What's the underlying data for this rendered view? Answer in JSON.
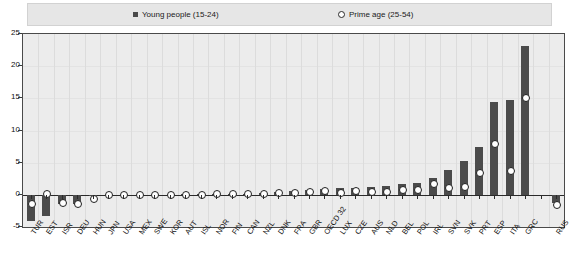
{
  "legend": {
    "young": {
      "label": "Young people (15-24)",
      "marker": "filled-square-icon",
      "color": "#4a4a4a"
    },
    "prime": {
      "label": "Prime age (25-54)",
      "marker": "open-circle-icon",
      "color": "#ffffff"
    }
  },
  "chart_data": {
    "type": "bar",
    "title": "",
    "subtitle": "",
    "xlabel": "",
    "ylabel": "",
    "ylim": [
      -5,
      25
    ],
    "yticks": [
      -5,
      0,
      5,
      10,
      15,
      20,
      25
    ],
    "ytick_labels": [
      "-5",
      "0",
      "5",
      "10",
      "15",
      "20",
      "25"
    ],
    "grid": true,
    "legend_position": "top",
    "categories": [
      "TUR",
      "EST",
      "ISR",
      "DEU",
      "HUN",
      "JPN",
      "USA",
      "MEX",
      "SWE",
      "KOR",
      "AUT",
      "ISL",
      "NOR",
      "FIN",
      "CAN",
      "NZL",
      "DNK",
      "FRA",
      "GBR",
      "OECD 32",
      "LUX",
      "CZE",
      "AUS",
      "NLD",
      "BEL",
      "POL",
      "IRL",
      "SVN",
      "SVK",
      "PRT",
      "ESP",
      "ITA",
      "GRC",
      "",
      "RUS"
    ],
    "series": [
      {
        "name": "Young people (15-24)",
        "type": "bar",
        "color": "#4b4b4b",
        "values": [
          -4.0,
          -3.3,
          -1.5,
          -1.5,
          -0.1,
          0.0,
          0.0,
          0.0,
          0.0,
          0.0,
          0.1,
          0.1,
          0.2,
          0.2,
          0.2,
          0.3,
          0.4,
          0.6,
          0.8,
          0.9,
          1.0,
          1.1,
          1.2,
          1.3,
          1.7,
          1.9,
          2.6,
          3.9,
          5.2,
          7.4,
          14.5,
          14.8,
          23.1,
          null,
          -1.3
        ]
      },
      {
        "name": "Prime age (25-54)",
        "type": "scatter",
        "marker": "open-circle",
        "color": "#ffffff",
        "values": [
          -1.2,
          0.3,
          -1.1,
          -1.2,
          -0.5,
          0.1,
          0.2,
          0.2,
          0.2,
          0.2,
          0.2,
          0.2,
          0.3,
          0.3,
          0.3,
          0.3,
          0.4,
          0.5,
          0.6,
          0.7,
          0.5,
          0.7,
          0.6,
          0.6,
          0.9,
          0.9,
          1.9,
          1.2,
          1.4,
          3.5,
          8.0,
          3.9,
          15.2,
          null,
          -1.4
        ]
      }
    ]
  }
}
